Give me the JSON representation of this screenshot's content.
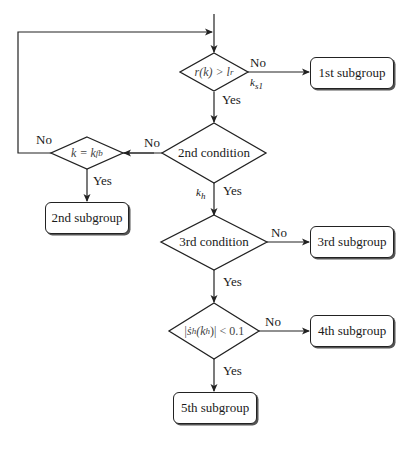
{
  "diagram": {
    "type": "flowchart",
    "decisions": {
      "d1": {
        "text": "r(k) > l_r",
        "display": "r(k) > l",
        "sub": "r"
      },
      "d2": {
        "text": "2nd condition"
      },
      "d_loop": {
        "text": "k = k_fb",
        "display": "k = k",
        "sub": "fb"
      },
      "d3": {
        "text": "3rd condition"
      },
      "d4": {
        "text": "|s_h(k_h)| < 0.1",
        "display": "|ṡ",
        "sub": "h",
        "mid": "(k",
        "sub2": "h",
        "tail": ")| < 0.1"
      }
    },
    "boxes": {
      "b1": "1st subgroup",
      "b2": "2nd subgroup",
      "b3": "3rd subgroup",
      "b4": "4th subgroup",
      "b5": "5th subgroup"
    },
    "edge_labels": {
      "d1_no": "No",
      "d1_yes": "Yes",
      "ks1_main": "k",
      "ks1_sub": "s1",
      "d2_no": "No",
      "d2_yes": "Yes",
      "kh_main": "k",
      "kh_sub": "h",
      "loop_no": "No",
      "loop_yes": "Yes",
      "d3_no": "No",
      "d3_yes": "Yes",
      "d4_no": "No",
      "d4_yes": "Yes"
    },
    "colors": {
      "line": "#222222",
      "background": "#ffffff"
    }
  }
}
